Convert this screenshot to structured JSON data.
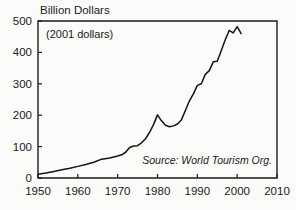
{
  "chart_data": {
    "type": "line",
    "title": "Billion Dollars",
    "subtitle": "(2001 dollars)",
    "source_note": "Source: World Tourism Org.",
    "xlabel": "",
    "ylabel": "Billion Dollars",
    "xlim": [
      1950,
      2010
    ],
    "ylim": [
      0,
      500
    ],
    "xticks": [
      1950,
      1960,
      1970,
      1980,
      1990,
      2000,
      2010
    ],
    "yticks": [
      0,
      100,
      200,
      300,
      400,
      500
    ],
    "grid": false,
    "legend": false,
    "line_color": "#141414",
    "series": [
      {
        "name": "International tourism receipts",
        "x": [
          1950,
          1952,
          1954,
          1956,
          1958,
          1960,
          1962,
          1964,
          1966,
          1968,
          1970,
          1971,
          1972,
          1973,
          1974,
          1975,
          1976,
          1977,
          1978,
          1979,
          1980,
          1981,
          1982,
          1983,
          1984,
          1985,
          1986,
          1987,
          1988,
          1989,
          1990,
          1991,
          1992,
          1993,
          1994,
          1995,
          1996,
          1997,
          1998,
          1999,
          2000,
          2001
        ],
        "values": [
          12,
          16,
          21,
          26,
          31,
          37,
          43,
          50,
          60,
          64,
          70,
          74,
          82,
          97,
          102,
          103,
          112,
          125,
          145,
          170,
          201,
          182,
          168,
          163,
          166,
          172,
          185,
          215,
          245,
          268,
          295,
          300,
          330,
          342,
          370,
          372,
          405,
          440,
          470,
          462,
          482,
          460
        ]
      }
    ]
  },
  "axis": {
    "y_tick_labels": [
      "0",
      "100",
      "200",
      "300",
      "400",
      "500"
    ],
    "x_tick_labels": [
      "1950",
      "1960",
      "1970",
      "1980",
      "1990",
      "2000",
      "2010"
    ]
  }
}
